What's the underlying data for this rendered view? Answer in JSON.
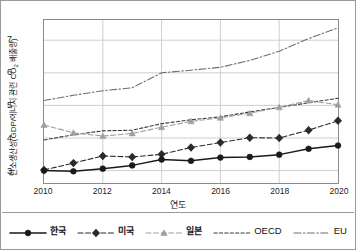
{
  "chart_data": {
    "type": "line",
    "title": "",
    "xlabel": "연도",
    "ylabel": "탄소생산성(GDP/에너지 관련 CO2 배출량)",
    "ylabel_main": "탄소생산성(GDP/에너지 관련 CO",
    "ylabel_sub": "2",
    "ylabel_tail": " 배출량)",
    "x": [
      2010,
      2011,
      2012,
      2013,
      2014,
      2015,
      2016,
      2017,
      2018,
      2019,
      2020
    ],
    "xticks": [
      "2010",
      "2012",
      "2014",
      "2016",
      "2018",
      "2020"
    ],
    "xtick_values": [
      2010,
      2012,
      2014,
      2016,
      2018,
      2020
    ],
    "yticks": [
      "3",
      "4",
      "5",
      "6",
      "7"
    ],
    "ytick_values": [
      3,
      4,
      5,
      6,
      7
    ],
    "xlim": [
      2010,
      2020
    ],
    "ylim": [
      2.62,
      7.62
    ],
    "grid": true,
    "legend_position": "bottom",
    "series": [
      {
        "name": "한국",
        "style": "solid",
        "marker": "circle",
        "color": "#1a1a1a",
        "values": [
          3.0,
          2.98,
          3.06,
          3.16,
          3.34,
          3.3,
          3.4,
          3.42,
          3.49,
          3.67,
          3.77
        ]
      },
      {
        "name": "미국",
        "style": "dashed",
        "marker": "diamond",
        "color": "#2b2b2b",
        "values": [
          3.02,
          3.23,
          3.45,
          3.42,
          3.5,
          3.71,
          3.86,
          4.01,
          4.0,
          4.24,
          4.53
        ]
      },
      {
        "name": "일본",
        "style": "dashed",
        "marker": "triangle",
        "color": "#9e9e9e",
        "values": [
          4.4,
          4.16,
          4.06,
          4.14,
          4.33,
          4.51,
          4.62,
          4.76,
          4.94,
          5.15,
          5.02
        ]
      },
      {
        "name": "OECD",
        "style": "dashed-fine",
        "marker": "none",
        "color": "#3a3a3a",
        "values": [
          3.94,
          4.1,
          4.22,
          4.24,
          4.44,
          4.56,
          4.65,
          4.8,
          4.94,
          5.08,
          5.22
        ]
      },
      {
        "name": "EU",
        "style": "dash-dot",
        "marker": "none",
        "color": "#6e6e6e",
        "values": [
          5.15,
          5.31,
          5.45,
          5.54,
          6.0,
          6.08,
          6.17,
          6.38,
          6.66,
          7.05,
          7.38
        ]
      }
    ]
  },
  "legend": {
    "items": [
      {
        "label": "한국",
        "script": "ko"
      },
      {
        "label": "미국",
        "script": "ko"
      },
      {
        "label": "일본",
        "script": "ko"
      },
      {
        "label": "OECD",
        "script": "latin"
      },
      {
        "label": "EU",
        "script": "latin"
      }
    ]
  },
  "colors": {
    "frame": "#8c8c8c",
    "grid": "#c9c9c9",
    "border": "#9a9a9a",
    "text": "#1a1a1a"
  }
}
